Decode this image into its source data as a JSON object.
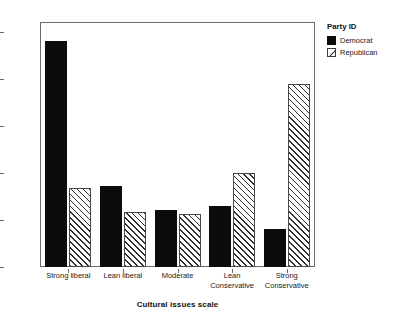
{
  "chart_data": {
    "type": "bar",
    "title": "",
    "xlabel": "Cultural issues scale",
    "ylabel": "",
    "categories": [
      "Strong liberal",
      "Lean liberal",
      "Moderate",
      "Lean\nConservative",
      "Strong\nConservative"
    ],
    "series": [
      {
        "name": "Democrat",
        "values": [
          48.2,
          17.3,
          12.1,
          12.9,
          8.2
        ],
        "color": "#0c0c0c",
        "fill": "solid"
      },
      {
        "name": "Republican",
        "values": [
          16.9,
          11.7,
          11.2,
          20.0,
          39.0
        ],
        "color": "#ffffff",
        "fill": "diagonal-hatch"
      }
    ],
    "ylim": [
      0,
      52
    ],
    "yticks": [
      0,
      10,
      20,
      30,
      40,
      50
    ],
    "ytick_labels": [
      "0%",
      "10%",
      "20%",
      "30%",
      "40%",
      "50%"
    ],
    "grid": false,
    "legend": {
      "title": "Party ID",
      "position": "right",
      "entries": [
        {
          "label": "Democrat",
          "swatch": "solid-black-square-icon"
        },
        {
          "label": "Republican",
          "swatch": "hatched-square-icon"
        }
      ]
    }
  }
}
